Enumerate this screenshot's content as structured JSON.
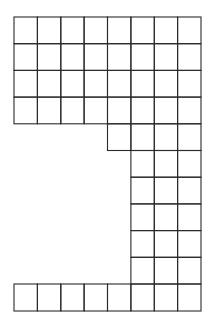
{
  "diagram": {
    "colors": {
      "line": "#2a2a2a",
      "background": "#ffffff"
    },
    "grid": {
      "col_x": [
        14,
        37.4,
        60.8,
        84.1,
        107.5,
        130.9,
        154.3,
        177.6,
        201
      ],
      "row_y": [
        17,
        43.7,
        70.4,
        97.1,
        123.8,
        150.5,
        177.2,
        203.9,
        230.6,
        257.3,
        284,
        311
      ],
      "rows": [
        {
          "row": 0,
          "start_col": 0,
          "end_col": 8
        },
        {
          "row": 1,
          "start_col": 0,
          "end_col": 8
        },
        {
          "row": 2,
          "start_col": 0,
          "end_col": 8
        },
        {
          "row": 3,
          "start_col": 0,
          "end_col": 8
        },
        {
          "row": 4,
          "start_col": 4,
          "end_col": 8
        },
        {
          "row": 5,
          "start_col": 5,
          "end_col": 8
        },
        {
          "row": 6,
          "start_col": 5,
          "end_col": 8
        },
        {
          "row": 7,
          "start_col": 5,
          "end_col": 8
        },
        {
          "row": 8,
          "start_col": 5,
          "end_col": 8
        },
        {
          "row": 9,
          "start_col": 5,
          "end_col": 8
        },
        {
          "row": 10,
          "start_col": 0,
          "end_col": 8
        }
      ]
    },
    "total_cells": 67
  }
}
